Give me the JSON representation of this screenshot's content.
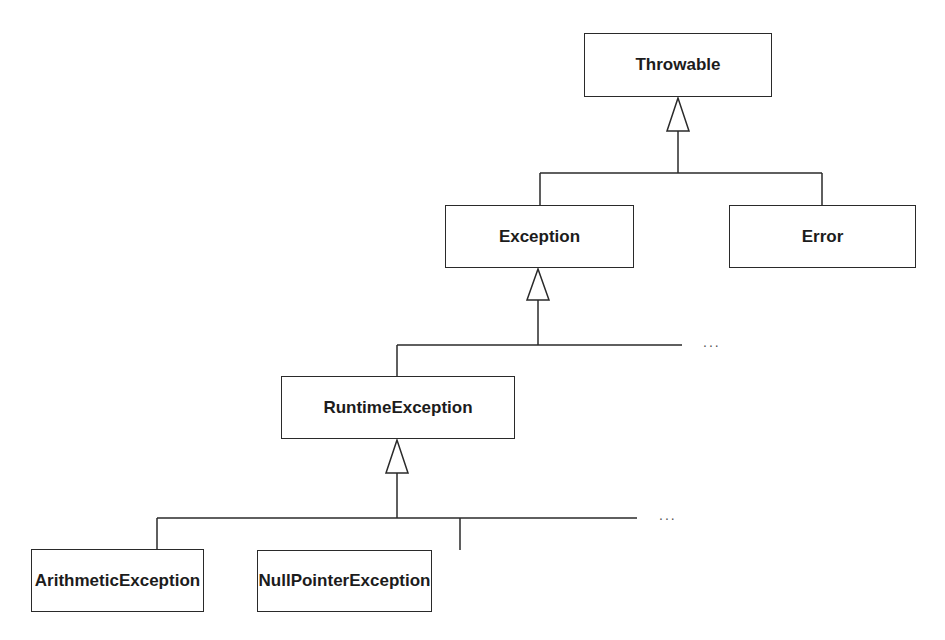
{
  "diagram": {
    "type": "uml-class-hierarchy",
    "classes": {
      "throwable": "Throwable",
      "exception": "Exception",
      "error": "Error",
      "runtime_exception": "RuntimeException",
      "arithmetic_exception": "ArithmeticException",
      "null_pointer_exception": "NullPointerException"
    },
    "ellipsis": "...",
    "relations": [
      {
        "child": "Exception",
        "parent": "Throwable",
        "kind": "generalization"
      },
      {
        "child": "Error",
        "parent": "Throwable",
        "kind": "generalization"
      },
      {
        "child": "RuntimeException",
        "parent": "Exception",
        "kind": "generalization"
      },
      {
        "child": "ArithmeticException",
        "parent": "RuntimeException",
        "kind": "generalization"
      },
      {
        "child": "NullPointerException",
        "parent": "RuntimeException",
        "kind": "generalization"
      }
    ],
    "colors": {
      "stroke": "#2a2a2a",
      "background": "#ffffff"
    }
  }
}
